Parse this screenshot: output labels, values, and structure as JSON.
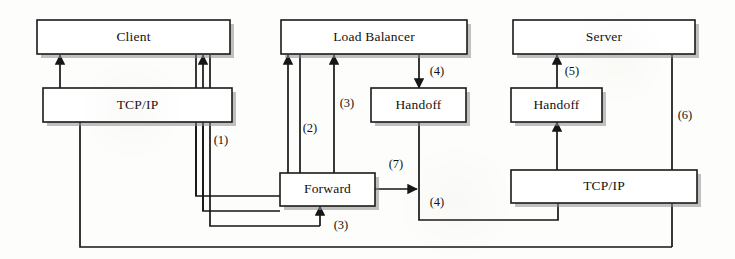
{
  "diagram": {
    "nodes": [
      {
        "id": "client",
        "label": "Client",
        "x": 37,
        "y": 20,
        "w": 193,
        "h": 34
      },
      {
        "id": "client_tcpip",
        "label": "TCP/IP",
        "x": 43,
        "y": 88,
        "w": 189,
        "h": 34
      },
      {
        "id": "load_balancer",
        "label": "Load Balancer",
        "x": 281,
        "y": 20,
        "w": 186,
        "h": 34
      },
      {
        "id": "lb_handoff",
        "label": "Handoff",
        "x": 371,
        "y": 88,
        "w": 95,
        "h": 34
      },
      {
        "id": "server",
        "label": "Server",
        "x": 513,
        "y": 20,
        "w": 182,
        "h": 34
      },
      {
        "id": "server_handoff",
        "label": "Handoff",
        "x": 511,
        "y": 88,
        "w": 91,
        "h": 34
      },
      {
        "id": "forward",
        "label": "Forward",
        "x": 280,
        "y": 173,
        "w": 95,
        "h": 33
      },
      {
        "id": "server_tcpip",
        "label": "TCP/IP",
        "x": 511,
        "y": 170,
        "w": 186,
        "h": 33
      }
    ],
    "edge_labels": [
      {
        "id": "step1",
        "text": "(1)",
        "x": 221,
        "y": 141
      },
      {
        "id": "step2",
        "text": "(2)",
        "x": 310,
        "y": 129
      },
      {
        "id": "step3a",
        "text": "(3)",
        "x": 347,
        "y": 104
      },
      {
        "id": "step4a",
        "text": "(4)",
        "x": 437,
        "y": 72
      },
      {
        "id": "step5",
        "text": "(5)",
        "x": 572,
        "y": 72
      },
      {
        "id": "step6",
        "text": "(6)",
        "x": 685,
        "y": 116
      },
      {
        "id": "step7",
        "text": "(7)",
        "x": 396,
        "y": 165
      },
      {
        "id": "step4b",
        "text": "(4)",
        "x": 437,
        "y": 203
      },
      {
        "id": "step3b",
        "text": "(3)",
        "x": 341,
        "y": 226
      }
    ],
    "edges": [
      {
        "id": "tcpip-to-client",
        "from": "client_tcpip",
        "to": "client",
        "label": ""
      },
      {
        "id": "client-return-up",
        "from": "forward",
        "to": "client",
        "label": "(1)"
      },
      {
        "id": "forward-to-loadbalancer",
        "from": "forward",
        "to": "load_balancer",
        "label": "(2)"
      },
      {
        "id": "forward-to-loadbalancer-3",
        "from": "forward",
        "to": "load_balancer",
        "label": "(3)"
      },
      {
        "id": "loadbalancer-to-handoff",
        "from": "load_balancer",
        "to": "lb_handoff",
        "label": "(4)"
      },
      {
        "id": "handoff-to-forward",
        "from": "lb_handoff",
        "to": "forward",
        "label": "(4)"
      },
      {
        "id": "forward-to-server-tcpip",
        "from": "forward",
        "to": "server_tcpip",
        "label": "(7)"
      },
      {
        "id": "server-tcpip-to-handoff",
        "from": "server_tcpip",
        "to": "server_handoff",
        "label": ""
      },
      {
        "id": "handoff-to-server",
        "from": "server_handoff",
        "to": "server",
        "label": "(5)"
      },
      {
        "id": "server-to-client",
        "from": "server",
        "to": "client",
        "label": "(6)"
      },
      {
        "id": "client-tcpip-to-forward",
        "from": "client_tcpip",
        "to": "forward",
        "label": "(3)"
      }
    ]
  }
}
